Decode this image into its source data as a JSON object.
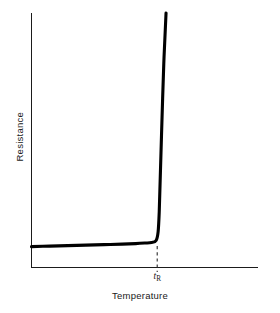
{
  "chart_data": {
    "type": "line",
    "title": "",
    "subtitle": "",
    "xlabel": "Temperature",
    "ylabel": "Resistance",
    "xlim": [
      0,
      100
    ],
    "ylim": [
      0,
      100
    ],
    "grid": false,
    "legend": null,
    "xticks": [],
    "xtick_labels": [],
    "yticks": [],
    "ytick_labels": [],
    "annotations": [
      {
        "name": "switching-temperature-tick",
        "symbol": "t",
        "subscript": "R",
        "text": "tR",
        "x": 55.5,
        "y": 0,
        "style": "italic-with-subscript",
        "marker": "dashed-vertical-line"
      }
    ],
    "series": [
      {
        "name": "resistance-curve",
        "color": "#000000",
        "linewidth": 3.1,
        "x": [
          0.0,
          8.0,
          16.0,
          24.0,
          32.0,
          40.0,
          46.0,
          50.0,
          53.0,
          55.0,
          55.9,
          56.4,
          56.8,
          57.4,
          58.4,
          59.4
        ],
        "y": [
          8.2,
          8.4,
          8.6,
          8.8,
          9.0,
          9.2,
          9.4,
          9.6,
          9.8,
          10.6,
          14.0,
          22.0,
          34.0,
          52.0,
          80.0,
          100.0
        ],
        "description": "Resistance stays nearly flat and low as temperature rises, then increases abruptly and almost vertically at the switching temperature tR (PTC thermistor characteristic)."
      }
    ]
  },
  "axes": {
    "y_axis_name": "resistance-axis",
    "x_axis_name": "temperature-axis"
  },
  "colors": {
    "background": "#ffffff",
    "axis": "#1b1b1b",
    "curve": "#000000",
    "dashed_marker": "#2a2a2a",
    "text": "#1a1a1a"
  }
}
